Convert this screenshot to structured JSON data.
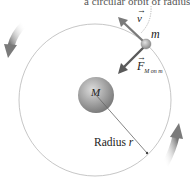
{
  "diagram": {
    "caption": "a circular orbit of radius r",
    "labels": {
      "velocity": "v",
      "small_mass": "m",
      "force_main": "F",
      "force_subscript": "M on m",
      "large_mass": "M",
      "radius_text": "Radius ",
      "radius_symbol": "r"
    },
    "vector_arrow_glyph": "→",
    "colors": {
      "orbit": "#b5b5b5",
      "large_mass": "#9a9a9a",
      "small_mass": "#a0a0a0",
      "vector": "#707070",
      "motion_arrow": "#8a8a8a",
      "text": "#222222"
    },
    "icons": {
      "motion_arrow_left": "curved-arrow-counterclockwise-icon",
      "motion_arrow_right": "curved-arrow-counterclockwise-icon"
    }
  }
}
